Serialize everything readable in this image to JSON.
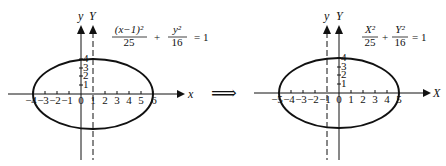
{
  "transition_arrow": "⟹",
  "left": {
    "axis_x_label": "x",
    "axis_y_label": "y",
    "axis_Y_label": "Y",
    "x_ticks": [
      "−4",
      "−3",
      "−2",
      "−1",
      "0",
      "1",
      "2",
      "3",
      "4",
      "5",
      "6"
    ],
    "y_ticks": [
      "4",
      "3",
      "2",
      "1"
    ],
    "equation": {
      "term1_num": "(x−1)²",
      "term1_den": "25",
      "plus": "+",
      "term2_num": "y²",
      "term2_den": "16",
      "rhs": "= 1"
    },
    "ellipse": {
      "center_x": 1,
      "center_y": 0,
      "a": 5,
      "b": 4
    }
  },
  "right": {
    "axis_x_label": "X",
    "axis_y_label": "y",
    "axis_Y_label": "Y",
    "x_ticks": [
      "−5",
      "−4",
      "−3",
      "−2",
      "−1",
      "0",
      "1",
      "2",
      "3",
      "4",
      "5"
    ],
    "y_ticks": [
      "4",
      "3",
      "2",
      "1"
    ],
    "equation": {
      "term1_num": "X²",
      "term1_den": "25",
      "plus": "+",
      "term2_num": "Y²",
      "term2_den": "16",
      "rhs": "= 1"
    },
    "ellipse": {
      "center_x": 0,
      "center_y": 0,
      "a": 5,
      "b": 4
    }
  }
}
